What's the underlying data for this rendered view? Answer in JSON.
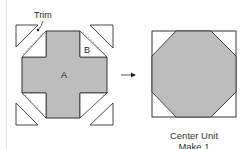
{
  "diagram": {
    "left_figure": {
      "trim_label": "Trim",
      "piece_a_label": "A",
      "piece_b_label": "B"
    },
    "right_figure": {
      "caption_line1": "Center Unit",
      "caption_line2": "Make 1"
    },
    "colors": {
      "fabric_gray": "#bdbdbd",
      "outline": "#333333",
      "background": "#ffffff"
    }
  }
}
